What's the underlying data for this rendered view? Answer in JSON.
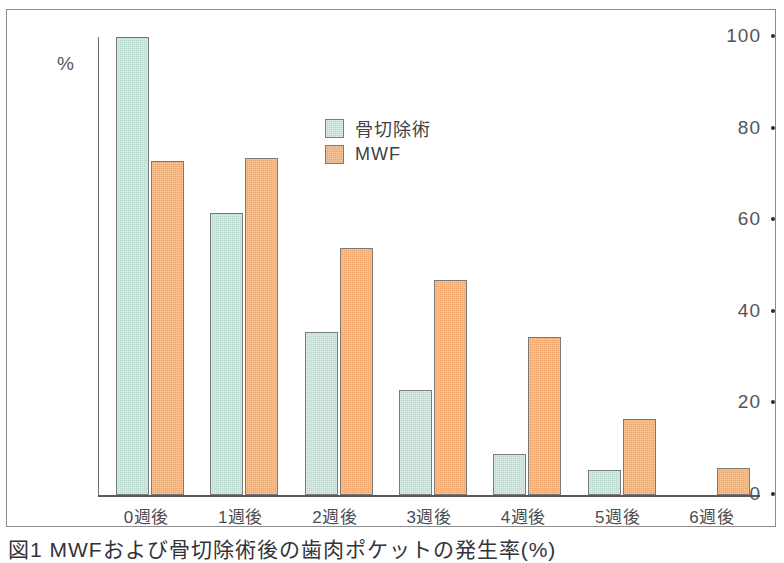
{
  "figure": {
    "caption": "図1 MWFおよび骨切除術後の歯肉ポケットの発生率(%)"
  },
  "chart_data": {
    "type": "bar",
    "title": "",
    "xlabel": "",
    "ylabel": "%",
    "ylim": [
      0,
      100
    ],
    "yticks": [
      0,
      20,
      40,
      60,
      80,
      100
    ],
    "grid": false,
    "legend_position": "inside-top-center",
    "categories": [
      "0週後",
      "1週後",
      "2週後",
      "3週後",
      "4週後",
      "5週後",
      "6週後"
    ],
    "series": [
      {
        "name": "骨切除術",
        "color": "#b9d9cd",
        "values": [
          100,
          61.5,
          35.5,
          23,
          9,
          5.5,
          0
        ]
      },
      {
        "name": "MWF",
        "color": "#f2a86c",
        "values": [
          73,
          73.5,
          54,
          47,
          34.5,
          16.5,
          6
        ]
      }
    ]
  },
  "axis": {
    "y_unit": "%",
    "tick_labels": [
      "100",
      "80",
      "60",
      "40",
      "20",
      "0"
    ]
  },
  "legend": {
    "items": [
      {
        "label": "骨切除術",
        "swatch": "green"
      },
      {
        "label": "MWF",
        "swatch": "orange"
      }
    ]
  }
}
